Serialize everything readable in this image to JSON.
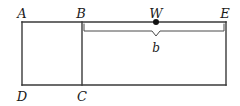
{
  "figure": {
    "background_color": "#ffffff",
    "stroke_color": "#3a3a3a",
    "label_color": "#1a1a1a"
  },
  "vertices": [
    {
      "name": "A",
      "label": "A",
      "x": 22,
      "y": 13
    },
    {
      "name": "B",
      "label": "B",
      "x": 81,
      "y": 13
    },
    {
      "name": "W",
      "label": "W",
      "x": 156,
      "y": 13
    },
    {
      "name": "E",
      "label": "E",
      "x": 225,
      "y": 13
    },
    {
      "name": "D",
      "label": "D",
      "x": 22,
      "y": 96
    },
    {
      "name": "C",
      "label": "C",
      "x": 82,
      "y": 96
    }
  ],
  "point_marker": {
    "name": "W",
    "x": 156,
    "y": 22,
    "radius": 3
  },
  "brace": {
    "label": "b",
    "label_x": 156,
    "label_y": 48,
    "left_x": 84,
    "right_x": 225,
    "y": 31,
    "notch_x": 156,
    "notch_depth": 4
  },
  "rectangle": {
    "left": 22,
    "top": 22,
    "right": 226,
    "bottom": 85
  },
  "divider": {
    "name": "segment-BC",
    "x": 82,
    "top": 22,
    "bottom": 85
  }
}
